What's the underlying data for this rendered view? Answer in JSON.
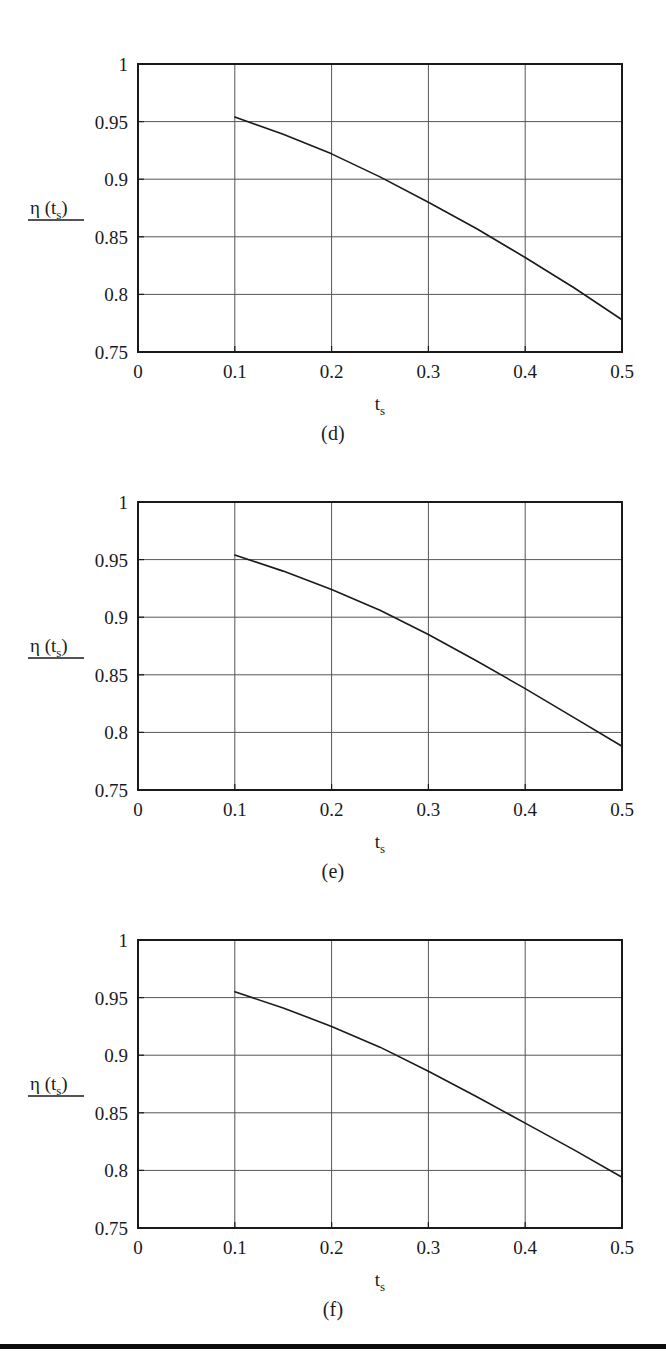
{
  "figure": {
    "panels": [
      {
        "caption": "(d)",
        "ylabel": "η (t",
        "ylabel_sub": "s",
        "ylabel_close": ")",
        "xlabel": "t",
        "xlabel_sub": "s"
      },
      {
        "caption": "(e)",
        "ylabel": "η (t",
        "ylabel_sub": "s",
        "ylabel_close": ")",
        "xlabel": "t",
        "xlabel_sub": "s"
      },
      {
        "caption": "(f)",
        "ylabel": "η (t",
        "ylabel_sub": "s",
        "ylabel_close": ")",
        "xlabel": "t",
        "xlabel_sub": "s"
      }
    ],
    "colors": {
      "axis": "#1a1a1a",
      "grid": "#555555",
      "curve": "#1a1a1a",
      "rule": "#0d0d0d",
      "background": "#ffffff"
    }
  },
  "chart_data": [
    {
      "type": "line",
      "title": "(d)",
      "xlabel": "t_s",
      "ylabel": "η (t_s)",
      "xlim": [
        0,
        0.5
      ],
      "ylim": [
        0.75,
        1
      ],
      "xticks": [
        0,
        0.1,
        0.2,
        0.3,
        0.4,
        0.5
      ],
      "xtick_labels": [
        "0",
        "0.1",
        "0.2",
        "0.3",
        "0.4",
        "0.5"
      ],
      "yticks": [
        0.75,
        0.8,
        0.85,
        0.9,
        0.95,
        1
      ],
      "ytick_labels": [
        "0.75",
        "0.8",
        "0.85",
        "0.9",
        "0.95",
        "1"
      ],
      "grid": true,
      "legend": null,
      "series": [
        {
          "name": "eta(t_s)",
          "x": [
            0.1,
            0.15,
            0.2,
            0.25,
            0.3,
            0.35,
            0.4,
            0.45,
            0.5
          ],
          "y": [
            0.954,
            0.939,
            0.922,
            0.902,
            0.88,
            0.857,
            0.832,
            0.806,
            0.778
          ]
        }
      ]
    },
    {
      "type": "line",
      "title": "(e)",
      "xlabel": "t_s",
      "ylabel": "η (t_s)",
      "xlim": [
        0,
        0.5
      ],
      "ylim": [
        0.75,
        1
      ],
      "xticks": [
        0,
        0.1,
        0.2,
        0.3,
        0.4,
        0.5
      ],
      "xtick_labels": [
        "0",
        "0.1",
        "0.2",
        "0.3",
        "0.4",
        "0.5"
      ],
      "yticks": [
        0.75,
        0.8,
        0.85,
        0.9,
        0.95,
        1
      ],
      "ytick_labels": [
        "0.75",
        "0.8",
        "0.85",
        "0.9",
        "0.95",
        "1"
      ],
      "grid": true,
      "legend": null,
      "series": [
        {
          "name": "eta(t_s)",
          "x": [
            0.1,
            0.15,
            0.2,
            0.25,
            0.3,
            0.35,
            0.4,
            0.45,
            0.5
          ],
          "y": [
            0.954,
            0.94,
            0.924,
            0.906,
            0.885,
            0.862,
            0.838,
            0.813,
            0.788
          ]
        }
      ]
    },
    {
      "type": "line",
      "title": "(f)",
      "xlabel": "t_s",
      "ylabel": "η (t_s)",
      "xlim": [
        0,
        0.5
      ],
      "ylim": [
        0.75,
        1
      ],
      "xticks": [
        0,
        0.1,
        0.2,
        0.3,
        0.4,
        0.5
      ],
      "xtick_labels": [
        "0",
        "0.1",
        "0.2",
        "0.3",
        "0.4",
        "0.5"
      ],
      "yticks": [
        0.75,
        0.8,
        0.85,
        0.9,
        0.95,
        1
      ],
      "ytick_labels": [
        "0.75",
        "0.8",
        "0.85",
        "0.9",
        "0.95",
        "1"
      ],
      "grid": true,
      "legend": null,
      "series": [
        {
          "name": "eta(t_s)",
          "x": [
            0.1,
            0.15,
            0.2,
            0.25,
            0.3,
            0.35,
            0.4,
            0.45,
            0.5
          ],
          "y": [
            0.955,
            0.941,
            0.925,
            0.907,
            0.886,
            0.864,
            0.841,
            0.818,
            0.794
          ]
        }
      ]
    }
  ]
}
